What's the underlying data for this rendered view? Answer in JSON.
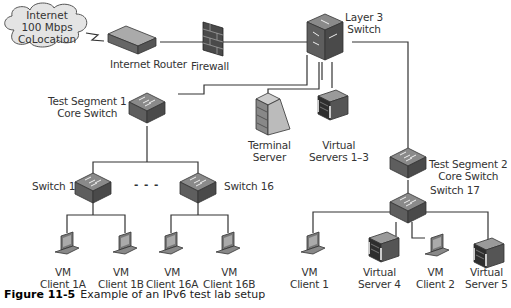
{
  "caption": {
    "figure_number": "Figure 11-5",
    "text": "Example of an IPv6 test lab setup"
  },
  "nodes": {
    "internet": {
      "line1": "Internet",
      "line2": "100 Mbps",
      "line3": "CoLocation"
    },
    "internet_router": {
      "label": "Internet Router"
    },
    "firewall": {
      "label": "Firewall"
    },
    "layer3_switch": {
      "line1": "Layer 3",
      "line2": "Switch"
    },
    "test_segment1": {
      "line1": "Test Segment 1",
      "line2": "Core Switch"
    },
    "terminal_server": {
      "line1": "Terminal",
      "line2": "Server"
    },
    "virtual_servers_1_3": {
      "line1": "Virtual",
      "line2": "Servers 1–3"
    },
    "test_segment2": {
      "line1": "Test Segment 2",
      "line2": "Core Switch"
    },
    "switch1": {
      "label": "Switch 1"
    },
    "ellipsis": {
      "label": "- - -"
    },
    "switch16": {
      "label": "Switch 16"
    },
    "switch17": {
      "label": "Switch 17"
    },
    "client_1a": {
      "line1": "VM",
      "line2": "Client 1A"
    },
    "client_1b": {
      "line1": "VM",
      "line2": "Client 1B"
    },
    "client_16a": {
      "line1": "VM",
      "line2": "Client 16A"
    },
    "client_16b": {
      "line1": "VM",
      "line2": "Client 16B"
    },
    "client_1": {
      "line1": "VM",
      "line2": "Client 1"
    },
    "virtual_server4": {
      "line1": "Virtual",
      "line2": "Server 4"
    },
    "client_2": {
      "line1": "VM",
      "line2": "Client 2"
    },
    "virtual_server5": {
      "line1": "Virtual",
      "line2": "Server 5"
    }
  },
  "colors": {
    "line": "#333333",
    "device_dark": "#5a5a5a",
    "device_light": "#9a9a9a",
    "cloud_fill": "#e4e4e4"
  }
}
